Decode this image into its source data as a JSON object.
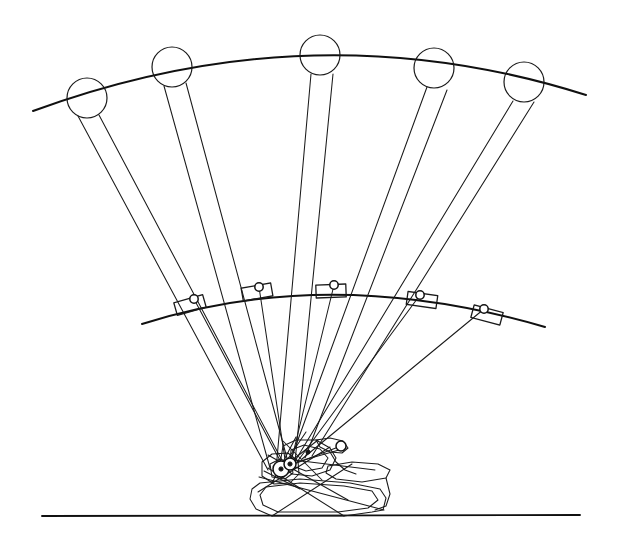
{
  "figure": {
    "kind": "line-drawing",
    "canvas": {
      "width": 620,
      "height": 547,
      "background": "#ffffff"
    },
    "colors": {
      "ink": "#1a1a1a",
      "ink_heavy": "#101010",
      "paper": "#ffffff"
    }
  },
  "ground_line": {
    "label": "ground-line",
    "x1": 42,
    "y1": 516,
    "x2": 580,
    "y2": 515
  },
  "upper_arc": {
    "label": "upper-path-arc",
    "start": {
      "x": 33,
      "y": 111
    },
    "control": {
      "x": 312,
      "y": 8
    },
    "end": {
      "x": 586,
      "y": 95
    }
  },
  "lower_arc": {
    "label": "lower-path-arc",
    "start": {
      "x": 142,
      "y": 324
    },
    "control": {
      "x": 330,
      "y": 264
    },
    "end": {
      "x": 545,
      "y": 327
    }
  },
  "end_circles": [
    {
      "id": "circle-1",
      "cx": 87,
      "cy": 98,
      "r": 20
    },
    {
      "id": "circle-2",
      "cx": 172,
      "cy": 67,
      "r": 20
    },
    {
      "id": "circle-3",
      "cx": 320,
      "cy": 55,
      "r": 20
    },
    {
      "id": "circle-4",
      "cx": 434,
      "cy": 68,
      "r": 20
    },
    {
      "id": "circle-5",
      "cx": 524,
      "cy": 82,
      "r": 20
    }
  ],
  "slider_blocks": [
    {
      "id": "slider-1",
      "cx": 190,
      "cy": 305,
      "angle": -16,
      "w": 30,
      "h": 13,
      "pin": {
        "x": 194,
        "y": 299
      }
    },
    {
      "id": "slider-2",
      "cx": 257,
      "cy": 292,
      "angle": -10,
      "w": 30,
      "h": 13,
      "pin": {
        "x": 259,
        "y": 287
      }
    },
    {
      "id": "slider-3",
      "cx": 331,
      "cy": 291,
      "angle": -2,
      "w": 30,
      "h": 13,
      "pin": {
        "x": 334,
        "y": 285
      }
    },
    {
      "id": "slider-4",
      "cx": 422,
      "cy": 300,
      "angle": 8,
      "w": 30,
      "h": 13,
      "pin": {
        "x": 420,
        "y": 295
      }
    },
    {
      "id": "slider-5",
      "cx": 487,
      "cy": 315,
      "angle": 15,
      "w": 30,
      "h": 13,
      "pin": {
        "x": 484,
        "y": 309
      }
    }
  ],
  "linkage_positions": [
    {
      "id": "position-1",
      "coupler_left": {
        "x1": 78,
        "y1": 116,
        "x2": 268,
        "y2": 470
      },
      "coupler_right": {
        "x1": 99,
        "y1": 115,
        "x2": 285,
        "y2": 466
      },
      "crank_pin": {
        "x": 194,
        "y": 299
      },
      "pivot_ground": {
        "x": 284,
        "y": 468
      }
    },
    {
      "id": "position-2",
      "coupler_left": {
        "x1": 164,
        "y1": 86,
        "x2": 270,
        "y2": 468
      },
      "coupler_right": {
        "x1": 186,
        "y1": 83,
        "x2": 288,
        "y2": 462
      },
      "crank_pin": {
        "x": 259,
        "y": 287
      },
      "pivot_ground": {
        "x": 286,
        "y": 466
      }
    },
    {
      "id": "position-3",
      "coupler_left": {
        "x1": 311,
        "y1": 74,
        "x2": 276,
        "y2": 470
      },
      "coupler_right": {
        "x1": 333,
        "y1": 74,
        "x2": 295,
        "y2": 462
      },
      "crank_pin": {
        "x": 334,
        "y": 285
      },
      "pivot_ground": {
        "x": 290,
        "y": 466
      }
    },
    {
      "id": "position-4",
      "coupler_left": {
        "x1": 427,
        "y1": 87,
        "x2": 288,
        "y2": 467
      },
      "coupler_right": {
        "x1": 447,
        "y1": 90,
        "x2": 305,
        "y2": 458
      },
      "crank_pin": {
        "x": 420,
        "y": 295
      },
      "pivot_ground": {
        "x": 297,
        "y": 462
      }
    },
    {
      "id": "position-5",
      "coupler_left": {
        "x1": 513,
        "y1": 101,
        "x2": 292,
        "y2": 466
      },
      "coupler_right": {
        "x1": 534,
        "y1": 102,
        "x2": 312,
        "y2": 456
      },
      "crank_pin": {
        "x": 484,
        "y": 309
      },
      "pivot_ground": {
        "x": 302,
        "y": 459
      }
    }
  ],
  "mechanism": {
    "label": "base-mechanism-cluster",
    "hub": {
      "x": 281,
      "y": 469,
      "r": 8
    },
    "secondary_hub": {
      "x": 290,
      "y": 464,
      "r": 6
    },
    "free_pin": {
      "x": 341,
      "y": 446,
      "r": 5
    },
    "ground_contacts": [
      {
        "x": 272,
        "y": 516
      },
      {
        "x": 344,
        "y": 516
      },
      {
        "x": 383,
        "y": 510
      }
    ]
  }
}
